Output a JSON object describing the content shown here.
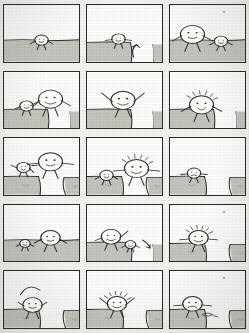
{
  "comic": {
    "title": "Stick figure gap-jumping comic strip",
    "medium": "scanned pencil sketch on paper",
    "ink_color": "#2b2a28",
    "paper_color": "#f4f3f1",
    "ground_fill": "#cfcdc8",
    "panel_fill": "#fbfaf8",
    "columns": 3,
    "rows": 5,
    "panel_count": 15,
    "panels": [
      {
        "index": 1,
        "row": 1,
        "col": 1,
        "caption": "A small round-headed figure stands alone on flat hatched ground.",
        "ground": "flat",
        "figures": [
          {
            "name": "small-figure",
            "size": "small",
            "x": 50,
            "y": 62,
            "mood": "neutral",
            "arms": "down"
          }
        ],
        "effects": []
      },
      {
        "index": 2,
        "row": 1,
        "col": 2,
        "caption": "The figure stands at the edge of a gap; an arrow curls up out of the chasm.",
        "ground": "ledge-left",
        "figures": [
          {
            "name": "small-figure",
            "size": "small",
            "x": 42,
            "y": 60,
            "mood": "neutral",
            "arms": "out"
          }
        ],
        "effects": [
          "up-arrow-in-gap"
        ]
      },
      {
        "index": 3,
        "row": 1,
        "col": 3,
        "caption": "A big round figure on the left and a small figure on the right stand on flat ground; a speck floats above.",
        "ground": "flat",
        "figures": [
          {
            "name": "big-figure",
            "size": "large",
            "x": 30,
            "y": 52,
            "mood": "neutral",
            "arms": "down"
          },
          {
            "name": "small-figure",
            "size": "small",
            "x": 68,
            "y": 64,
            "mood": "neutral",
            "arms": "down"
          }
        ],
        "effects": [
          "floating-speck"
        ]
      },
      {
        "index": 4,
        "row": 2,
        "col": 1,
        "caption": "Small figure with a raised arm beside a big smiling figure, both on a ledge above a gap.",
        "ground": "ledge-left",
        "figures": [
          {
            "name": "small-figure",
            "size": "small",
            "x": 30,
            "y": 60,
            "mood": "neutral",
            "arms": "raised-one"
          },
          {
            "name": "big-figure",
            "size": "large",
            "x": 62,
            "y": 48,
            "mood": "happy",
            "arms": "down"
          }
        ],
        "effects": []
      },
      {
        "index": 5,
        "row": 2,
        "col": 2,
        "caption": "A big round figure throws both arms up in excitement on the ledge.",
        "ground": "ledge-left",
        "figures": [
          {
            "name": "big-figure",
            "size": "large",
            "x": 48,
            "y": 50,
            "mood": "excited",
            "arms": "both-up"
          }
        ],
        "effects": []
      },
      {
        "index": 6,
        "row": 2,
        "col": 3,
        "caption": "The figure crouches at the ledge edge with spiky motion lines bursting from its head.",
        "ground": "ledge-left",
        "figures": [
          {
            "name": "big-figure",
            "size": "large",
            "x": 42,
            "y": 58,
            "mood": "worried",
            "arms": "down"
          }
        ],
        "effects": [
          "burst-lines"
        ]
      },
      {
        "index": 7,
        "row": 3,
        "col": 1,
        "caption": "Mid-air: a small figure tumbles left while a large ball-shaped figure sails right over the chasm.",
        "ground": "chasm",
        "figures": [
          {
            "name": "small-figure",
            "size": "small",
            "x": 26,
            "y": 52,
            "mood": "alarmed",
            "arms": "flailing"
          },
          {
            "name": "big-figure",
            "size": "large",
            "x": 62,
            "y": 42,
            "mood": "neutral",
            "arms": "out"
          }
        ],
        "effects": [
          "motion-dash"
        ]
      },
      {
        "index": 8,
        "row": 3,
        "col": 2,
        "caption": "Small figure on the left ledge, a grinning larger figure on the right ledge with arms spread.",
        "ground": "chasm",
        "figures": [
          {
            "name": "small-figure",
            "size": "small",
            "x": 26,
            "y": 66,
            "mood": "neutral",
            "arms": "down"
          },
          {
            "name": "big-figure",
            "size": "large",
            "x": 66,
            "y": 54,
            "mood": "happy",
            "arms": "out"
          }
        ],
        "effects": [
          "burst-lines"
        ]
      },
      {
        "index": 9,
        "row": 3,
        "col": 3,
        "caption": "Only one figure remains on the left ledge; the right ledge is empty across the chasm.",
        "ground": "chasm",
        "figures": [
          {
            "name": "small-figure",
            "size": "small",
            "x": 32,
            "y": 62,
            "mood": "sad",
            "arms": "out"
          }
        ],
        "effects": []
      },
      {
        "index": 10,
        "row": 4,
        "col": 1,
        "caption": "A small figure and a medium figure stand apart on flat ground.",
        "ground": "flat",
        "figures": [
          {
            "name": "small-figure",
            "size": "tiny",
            "x": 28,
            "y": 68,
            "mood": "neutral",
            "arms": "down"
          },
          {
            "name": "big-figure",
            "size": "medium",
            "x": 62,
            "y": 58,
            "mood": "neutral",
            "arms": "down"
          }
        ],
        "effects": []
      },
      {
        "index": 11,
        "row": 4,
        "col": 2,
        "caption": "Left figure waves an arm; a small figure peeks at the ledge edge with an arrow beside it.",
        "ground": "ledge-left",
        "figures": [
          {
            "name": "big-figure",
            "size": "medium",
            "x": 32,
            "y": 56,
            "mood": "excited",
            "arms": "raised-one"
          },
          {
            "name": "small-figure",
            "size": "tiny",
            "x": 58,
            "y": 70,
            "mood": "neutral",
            "arms": "down"
          }
        ],
        "effects": [
          "down-arrow"
        ]
      },
      {
        "index": 12,
        "row": 4,
        "col": 3,
        "caption": "An excited spiky-haired figure stands on the left ledge facing the chasm.",
        "ground": "chasm",
        "figures": [
          {
            "name": "big-figure",
            "size": "medium",
            "x": 38,
            "y": 58,
            "mood": "excited",
            "arms": "out"
          }
        ],
        "effects": [
          "burst-lines",
          "floating-speck"
        ]
      },
      {
        "index": 13,
        "row": 5,
        "col": 1,
        "caption": "A curved arc traces a planned jump above the figure on the left ledge.",
        "ground": "chasm",
        "figures": [
          {
            "name": "big-figure",
            "size": "medium",
            "x": 38,
            "y": 60,
            "mood": "neutral",
            "arms": "up-small"
          }
        ],
        "effects": [
          "jump-arc"
        ]
      },
      {
        "index": 14,
        "row": 5,
        "col": 2,
        "caption": "The figure raises both arms on the left ledge, ready to go.",
        "ground": "chasm",
        "figures": [
          {
            "name": "big-figure",
            "size": "medium",
            "x": 40,
            "y": 58,
            "mood": "excited",
            "arms": "both-up"
          }
        ],
        "effects": [
          "burst-lines"
        ]
      },
      {
        "index": 15,
        "row": 5,
        "col": 3,
        "caption": "The figure sits quietly on the left ledge beside a scribbled shape; the chasm waits.",
        "ground": "chasm",
        "figures": [
          {
            "name": "big-figure",
            "size": "medium",
            "x": 30,
            "y": 58,
            "mood": "sad",
            "arms": "out"
          }
        ],
        "effects": [
          "ground-scribble",
          "floating-speck"
        ]
      }
    ]
  }
}
